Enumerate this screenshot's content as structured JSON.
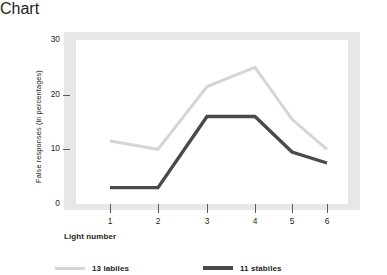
{
  "chart_data": {
    "type": "line",
    "title": "",
    "xlabel": "Light number",
    "ylabel": "False responses (in percentages)",
    "x": [
      1,
      2,
      3,
      4,
      5,
      6
    ],
    "xtick_labels": [
      "1",
      "2",
      "3",
      "4",
      "5",
      "6"
    ],
    "ytick_labels": [
      "0",
      "10",
      "20",
      "30"
    ],
    "yticks": [
      0,
      10,
      20,
      30
    ],
    "ylim": [
      0,
      30
    ],
    "xlim": [
      0.45,
      6.55
    ],
    "grid": false,
    "legend_position": "bottom",
    "series": [
      {
        "name": "13 labiles",
        "color": "#d5d5d5",
        "line_width": 3,
        "values": [
          11.5,
          10.0,
          21.5,
          25.0,
          15.5,
          10.0
        ]
      },
      {
        "name": "11 stabiles",
        "color": "#4a4a4a",
        "line_width": 3.4,
        "values": [
          3.0,
          3.0,
          16.0,
          16.0,
          9.5,
          7.5
        ]
      }
    ]
  },
  "figure": {
    "frame_color": "#e7e7e7",
    "plot_background": "#ffffff",
    "axis_color": "#58595b",
    "text_color": "#231f20"
  },
  "legend": {
    "items": [
      {
        "label": "13 labiles",
        "color": "#d5d5d5"
      },
      {
        "label": "11 stabiles",
        "color": "#4a4a4a"
      }
    ]
  }
}
